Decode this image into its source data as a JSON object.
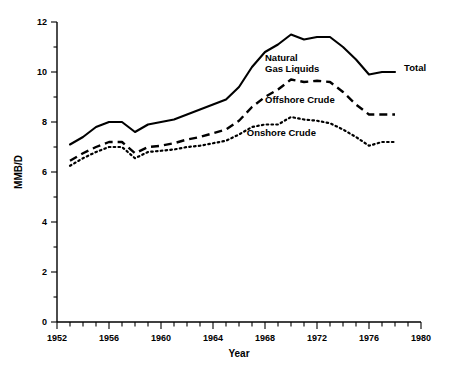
{
  "chart_data": {
    "type": "line",
    "title": "",
    "xlabel": "Year",
    "ylabel": "MMB/D",
    "xlim": [
      1952,
      1980
    ],
    "ylim": [
      0,
      12
    ],
    "grid": false,
    "legend_position": "inline-annotations",
    "x_major_ticks": [
      1952,
      1956,
      1960,
      1964,
      1968,
      1972,
      1976,
      1980
    ],
    "x_major_tick_labels": [
      "1952",
      "1956",
      "1960",
      "1964",
      "1968",
      "1972",
      "1976",
      "1980"
    ],
    "x_minor_tick_step": 1,
    "y_major_ticks": [
      0,
      2,
      4,
      6,
      8,
      10,
      12
    ],
    "y_major_tick_labels": [
      "0",
      "2",
      "4",
      "6",
      "8",
      "10",
      "12"
    ],
    "y_minor_ticks": [
      1,
      3,
      5,
      7,
      9,
      11
    ],
    "x": [
      1953,
      1954,
      1955,
      1956,
      1957,
      1958,
      1959,
      1960,
      1961,
      1962,
      1963,
      1964,
      1965,
      1966,
      1967,
      1968,
      1969,
      1970,
      1971,
      1972,
      1973,
      1974,
      1975,
      1976,
      1977,
      1978
    ],
    "series": [
      {
        "name": "Total",
        "style": "solid",
        "label": "Total",
        "values": [
          7.1,
          7.4,
          7.8,
          8.0,
          8.0,
          7.6,
          7.9,
          8.0,
          8.1,
          8.3,
          8.5,
          8.7,
          8.9,
          9.4,
          10.2,
          10.8,
          11.1,
          11.5,
          11.3,
          11.4,
          11.4,
          11.0,
          10.5,
          9.9,
          10.0,
          10.0
        ]
      },
      {
        "name": "Offshore Crude",
        "style": "dashed",
        "label": "Offshore Crude",
        "values": [
          6.45,
          6.75,
          7.0,
          7.2,
          7.2,
          6.75,
          7.0,
          7.05,
          7.15,
          7.3,
          7.4,
          7.55,
          7.7,
          8.05,
          8.6,
          9.0,
          9.3,
          9.7,
          9.6,
          9.65,
          9.6,
          9.2,
          8.7,
          8.3,
          8.3,
          8.3
        ]
      },
      {
        "name": "Onshore Crude",
        "style": "dotted",
        "label": "Onshore Crude",
        "values": [
          6.25,
          6.55,
          6.8,
          7.0,
          7.0,
          6.55,
          6.8,
          6.85,
          6.9,
          7.0,
          7.05,
          7.15,
          7.25,
          7.5,
          7.8,
          7.9,
          7.9,
          8.2,
          8.1,
          8.05,
          7.95,
          7.7,
          7.4,
          7.05,
          7.2,
          7.2
        ]
      }
    ],
    "annotations": [
      {
        "text_line1": "Natural",
        "text_line2": "Gas Liquids",
        "x": 1968.0,
        "y": 10.45
      },
      {
        "text": "Offshore Crude",
        "x": 1968.0,
        "y": 8.75
      },
      {
        "text": "Onshore Crude",
        "x": 1966.6,
        "y": 7.45
      },
      {
        "text": "Total",
        "x": 1978.7,
        "y": 10.05
      }
    ]
  }
}
